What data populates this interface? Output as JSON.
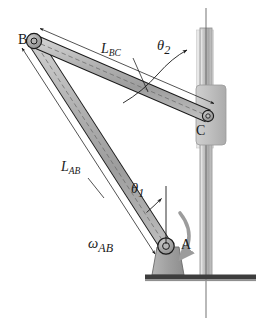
{
  "figure": {
    "type": "mechanical-linkage-diagram",
    "cropped_header_text": "",
    "colors": {
      "outline": "#1a1a1a",
      "link_fill": "#a8a8a8",
      "link_fill_light": "#c2c2c2",
      "joint_fill": "#9a9a9a",
      "slider_fill": "#bdbdbd",
      "rod_fill": "#b5b5b5",
      "rod_fill_light": "#d8d8d8",
      "support_fill": "#9e9e9e",
      "ground_fill": "#3d3d3d",
      "omega_arrow": "#9c9c9c",
      "centerline": "#5a5a5a",
      "background": "#ffffff"
    }
  },
  "labels": {
    "joint_b": "B",
    "joint_c": "C",
    "joint_a": "A",
    "link_bc": "L",
    "link_bc_sub": "BC",
    "link_ab": "L",
    "link_ab_sub": "AB",
    "theta_2": "θ",
    "theta_2_sub": "2",
    "theta_1": "θ",
    "theta_1_sub": "1",
    "omega_ab": "ω",
    "omega_ab_sub": "AB"
  },
  "geometry": {
    "joint_a": {
      "x": 166,
      "y": 246,
      "label_offset_x": 14,
      "label_offset_y": -4
    },
    "joint_b": {
      "x": 34,
      "y": 41,
      "label_offset_x": -18,
      "label_offset_y": -5
    },
    "joint_c": {
      "x": 208,
      "y": 116,
      "label_offset_x": -6,
      "label_offset_y": 14
    },
    "link_ab": {
      "from": "A",
      "to": "B",
      "width": 11
    },
    "link_bc": {
      "from": "B",
      "to": "C",
      "width": 11
    },
    "guide_rod": {
      "x_left": 200,
      "x_right": 212,
      "y_top": 28,
      "y_bottom": 277
    },
    "slider_block": {
      "x": 196,
      "y": 85,
      "width": 30,
      "height": 60
    },
    "ground_bar": {
      "x_left": 145,
      "x_right": 256,
      "y": 275,
      "height": 5
    },
    "support_a": {
      "x_left": 152,
      "x_right": 184,
      "y_top": 246,
      "y_bottom": 275
    },
    "centerline": {
      "x": 206,
      "y_top": 8,
      "y_bottom": 318
    },
    "theta_1_reference": {
      "x": 166,
      "y_top": 186,
      "y_bottom": 246
    },
    "theta_2_reference": {
      "x": 206,
      "y_top": 40,
      "y_bottom": 116
    }
  },
  "annotations": {
    "dimension_link_bc": "leader line from L_BC label to midspan of link BC",
    "dimension_link_ab": "leader line from L_AB label to midspan of link AB",
    "dimension_arrows_bc": "double-arrow dimension line parallel to link BC from B to C",
    "dimension_arrows_ab": "double-arrow dimension line parallel to link AB from B to A",
    "theta_1_arc": "arc from vertical reference at A to link AB, arrow at vertical",
    "theta_2_arc": "arc from link BC to vertical rod centerline at C, arrow at vertical",
    "omega_arrow": "thick curved arrow about pin A indicating angular velocity direction"
  }
}
